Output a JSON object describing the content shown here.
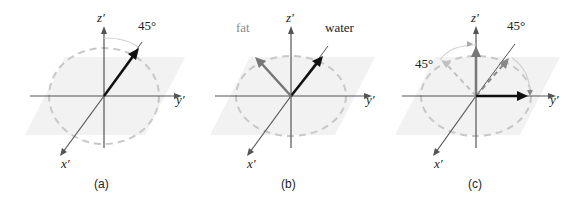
{
  "figure": {
    "panels": [
      {
        "id": "a",
        "caption": "(a)",
        "axes": {
          "z": "z′",
          "y": "y′",
          "x": "x′"
        },
        "angle_label": "45°"
      },
      {
        "id": "b",
        "caption": "(b)",
        "axes": {
          "z": "z′",
          "y": "y′",
          "x": "x′"
        },
        "vector_labels": {
          "fat": "fat",
          "water": "water"
        }
      },
      {
        "id": "c",
        "caption": "(c)",
        "axes": {
          "z": "z′",
          "y": "y′",
          "x": "x′"
        },
        "angle_label_right": "45°",
        "angle_label_left": "45°"
      }
    ],
    "colors": {
      "plane": "#f2f2f2",
      "axis": "#555555",
      "dashed_circle": "#c8c8c8",
      "water_vector": "#111111",
      "fat_vector": "#777777",
      "light_arrow": "#c0c0c0"
    }
  }
}
